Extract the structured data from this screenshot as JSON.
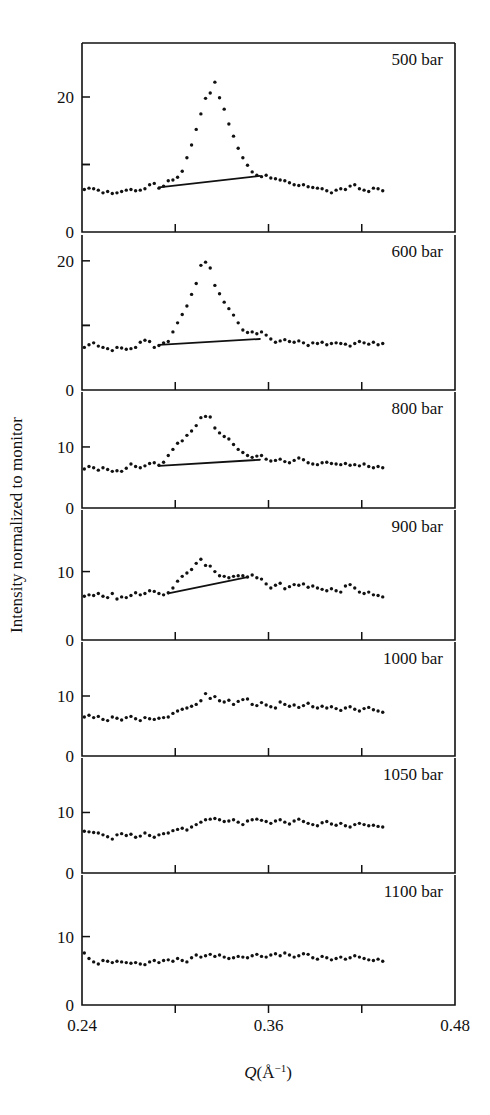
{
  "figure": {
    "type": "multi-panel-scatter",
    "y_axis_title": "Intensity normalized to monitor",
    "x_axis_title_main": "Q(",
    "x_axis_title_unit": "Å",
    "x_axis_title_exp": "−1",
    "x_axis_title_close": ")",
    "x_axis_title_full": "Q(Å⁻¹)"
  },
  "chart_data": {
    "type": "scatter",
    "title": "",
    "xlabel": "Q(Å⁻¹)",
    "ylabel": "Intensity normalized to monitor",
    "xlim": [
      0.24,
      0.48
    ],
    "xticks": [
      0.24,
      0.3,
      0.36,
      0.42,
      0.48
    ],
    "xtick_labels": [
      "0.24",
      "",
      "0.36",
      "",
      "0.48"
    ],
    "grid": false,
    "legend": "none",
    "panel_label_position": "top-right",
    "panels": [
      {
        "label": "500 bar",
        "ylim": [
          0,
          28
        ],
        "yticks": [
          0,
          10,
          20
        ],
        "ytick_labels": [
          "0",
          "",
          "20"
        ],
        "fit_line": {
          "x": [
            0.2895,
            0.3545
          ],
          "y": [
            6.6,
            8.3
          ]
        },
        "x": [
          0.2415,
          0.2445,
          0.2475,
          0.2505,
          0.2535,
          0.2565,
          0.2595,
          0.2625,
          0.2655,
          0.2685,
          0.2715,
          0.2745,
          0.2775,
          0.2805,
          0.2835,
          0.2865,
          0.2895,
          0.2925,
          0.2955,
          0.2985,
          0.3015,
          0.3045,
          0.3075,
          0.3105,
          0.3135,
          0.3165,
          0.3195,
          0.3225,
          0.3255,
          0.3285,
          0.3315,
          0.3345,
          0.3375,
          0.3405,
          0.3435,
          0.3465,
          0.3495,
          0.3525,
          0.3555,
          0.3585,
          0.3615,
          0.3645,
          0.3675,
          0.3705,
          0.3735,
          0.3765,
          0.3795,
          0.3825,
          0.3855,
          0.3885,
          0.3915,
          0.3945,
          0.3975,
          0.4005,
          0.4035,
          0.4065,
          0.4095,
          0.4125,
          0.4155,
          0.4185,
          0.4215,
          0.4245,
          0.4275,
          0.4305,
          0.4335
        ],
        "y": [
          6.3,
          6.5,
          6.4,
          6.2,
          5.8,
          6.0,
          5.7,
          5.8,
          6.0,
          6.2,
          6.3,
          6.1,
          6.2,
          6.4,
          7.0,
          7.2,
          6.5,
          6.8,
          7.6,
          7.7,
          8.1,
          9.0,
          11.0,
          12.9,
          15.2,
          17.5,
          19.8,
          20.6,
          22.2,
          19.9,
          18.2,
          16.0,
          14.2,
          12.4,
          11.0,
          9.9,
          8.9,
          8.4,
          8.2,
          8.4,
          8.0,
          7.9,
          7.7,
          7.6,
          7.3,
          7.0,
          6.9,
          7.0,
          6.7,
          6.6,
          6.5,
          6.4,
          6.1,
          5.8,
          6.2,
          6.4,
          6.3,
          6.8,
          7.0,
          6.4,
          6.2,
          6.0,
          6.5,
          6.4,
          6.1
        ]
      },
      {
        "label": "600 bar",
        "ylim": [
          0,
          24
        ],
        "yticks": [
          0,
          10,
          20
        ],
        "ytick_labels": [
          "0",
          "",
          "20"
        ],
        "fit_line": {
          "x": [
            0.2895,
            0.3545
          ],
          "y": [
            7.0,
            7.9
          ]
        },
        "x": [
          0.2415,
          0.2445,
          0.2475,
          0.2505,
          0.2535,
          0.2565,
          0.2595,
          0.2625,
          0.2655,
          0.2685,
          0.2715,
          0.2745,
          0.2775,
          0.2805,
          0.2835,
          0.2865,
          0.2895,
          0.2925,
          0.2955,
          0.2985,
          0.3015,
          0.3045,
          0.3075,
          0.3105,
          0.3135,
          0.3165,
          0.3195,
          0.3225,
          0.3255,
          0.3285,
          0.3315,
          0.3345,
          0.3375,
          0.3405,
          0.3435,
          0.3465,
          0.3495,
          0.3525,
          0.3555,
          0.3585,
          0.3615,
          0.3645,
          0.3675,
          0.3705,
          0.3735,
          0.3765,
          0.3795,
          0.3825,
          0.3855,
          0.3885,
          0.3915,
          0.3945,
          0.3975,
          0.4005,
          0.4035,
          0.4065,
          0.4095,
          0.4125,
          0.4155,
          0.4185,
          0.4215,
          0.4245,
          0.4275,
          0.4305,
          0.4335
        ],
        "y": [
          6.6,
          7.0,
          7.3,
          6.8,
          6.6,
          6.4,
          6.1,
          6.6,
          6.5,
          6.3,
          6.4,
          6.6,
          7.4,
          7.7,
          7.5,
          6.6,
          6.9,
          7.3,
          7.5,
          9.0,
          10.4,
          11.7,
          13.0,
          14.8,
          16.5,
          19.3,
          19.8,
          18.9,
          16.2,
          14.9,
          13.6,
          12.6,
          11.6,
          10.4,
          9.3,
          8.9,
          9.0,
          8.7,
          9.0,
          8.5,
          7.9,
          7.4,
          7.6,
          7.8,
          7.5,
          7.4,
          7.6,
          7.3,
          6.9,
          7.3,
          7.2,
          7.4,
          7.0,
          7.2,
          7.3,
          7.2,
          7.1,
          6.8,
          7.2,
          7.5,
          7.3,
          7.1,
          7.4,
          7.0,
          7.2
        ]
      },
      {
        "label": "800 bar",
        "ylim": [
          0,
          19
        ],
        "yticks": [
          0,
          10
        ],
        "ytick_labels": [
          "0",
          "10"
        ],
        "fit_line": {
          "x": [
            0.2895,
            0.3545
          ],
          "y": [
            6.9,
            7.9
          ]
        },
        "x": [
          0.2415,
          0.2445,
          0.2475,
          0.2505,
          0.2535,
          0.2565,
          0.2595,
          0.2625,
          0.2655,
          0.2685,
          0.2715,
          0.2745,
          0.2775,
          0.2805,
          0.2835,
          0.2865,
          0.2895,
          0.2925,
          0.2955,
          0.2985,
          0.3015,
          0.3045,
          0.3075,
          0.3105,
          0.3135,
          0.3165,
          0.3195,
          0.3225,
          0.3255,
          0.3285,
          0.3315,
          0.3345,
          0.3375,
          0.3405,
          0.3435,
          0.3465,
          0.3495,
          0.3525,
          0.3555,
          0.3585,
          0.3615,
          0.3645,
          0.3675,
          0.3705,
          0.3735,
          0.3765,
          0.3795,
          0.3825,
          0.3855,
          0.3885,
          0.3915,
          0.3945,
          0.3975,
          0.4005,
          0.4035,
          0.4065,
          0.4095,
          0.4125,
          0.4155,
          0.4185,
          0.4215,
          0.4245,
          0.4275,
          0.4305,
          0.4335
        ],
        "y": [
          6.4,
          6.8,
          6.6,
          6.2,
          6.6,
          6.3,
          6.0,
          6.1,
          6.0,
          6.5,
          7.2,
          6.8,
          6.6,
          6.9,
          7.3,
          7.4,
          7.0,
          7.5,
          8.6,
          9.6,
          10.6,
          11.0,
          11.9,
          12.6,
          13.5,
          14.8,
          15.0,
          14.9,
          13.1,
          12.3,
          11.7,
          11.3,
          10.4,
          9.6,
          9.1,
          8.6,
          8.3,
          8.5,
          8.6,
          8.0,
          7.7,
          7.8,
          8.0,
          7.6,
          7.4,
          7.8,
          8.2,
          7.9,
          7.4,
          7.2,
          7.1,
          7.4,
          7.5,
          7.3,
          7.2,
          7.1,
          7.3,
          7.0,
          7.1,
          6.9,
          7.2,
          6.8,
          6.6,
          6.8,
          6.6
        ]
      },
      {
        "label": "900 bar",
        "ylim": [
          0,
          19
        ],
        "yticks": [
          0,
          10
        ],
        "ytick_labels": [
          "0",
          "10"
        ],
        "fit_line": {
          "x": [
            0.2955,
            0.3465
          ],
          "y": [
            6.8,
            9.2
          ]
        },
        "x": [
          0.2415,
          0.2445,
          0.2475,
          0.2505,
          0.2535,
          0.2565,
          0.2595,
          0.2625,
          0.2655,
          0.2685,
          0.2715,
          0.2745,
          0.2775,
          0.2805,
          0.2835,
          0.2865,
          0.2895,
          0.2925,
          0.2955,
          0.2985,
          0.3015,
          0.3045,
          0.3075,
          0.3105,
          0.3135,
          0.3165,
          0.3195,
          0.3225,
          0.3255,
          0.3285,
          0.3315,
          0.3345,
          0.3375,
          0.3405,
          0.3435,
          0.3465,
          0.3495,
          0.3525,
          0.3555,
          0.3585,
          0.3615,
          0.3645,
          0.3675,
          0.3705,
          0.3735,
          0.3765,
          0.3795,
          0.3825,
          0.3855,
          0.3885,
          0.3915,
          0.3945,
          0.3975,
          0.4005,
          0.4035,
          0.4065,
          0.4095,
          0.4125,
          0.4155,
          0.4185,
          0.4215,
          0.4245,
          0.4275,
          0.4305,
          0.4335
        ],
        "y": [
          6.4,
          6.6,
          6.5,
          6.8,
          6.4,
          6.2,
          6.8,
          6.0,
          6.3,
          6.2,
          6.5,
          6.9,
          6.6,
          6.8,
          7.2,
          7.1,
          6.8,
          6.6,
          6.9,
          7.6,
          8.6,
          9.3,
          9.8,
          10.3,
          11.2,
          11.8,
          10.9,
          10.8,
          10.0,
          9.4,
          9.3,
          9.1,
          9.3,
          9.4,
          9.4,
          9.2,
          9.5,
          9.1,
          8.9,
          8.2,
          7.6,
          8.0,
          8.3,
          7.5,
          7.8,
          8.1,
          8.0,
          8.2,
          7.7,
          7.9,
          7.6,
          7.4,
          7.2,
          7.5,
          7.2,
          7.0,
          7.9,
          8.1,
          7.6,
          7.0,
          6.8,
          7.0,
          6.6,
          6.5,
          6.3
        ]
      },
      {
        "label": "1000 bar",
        "ylim": [
          0,
          19
        ],
        "yticks": [
          0,
          10
        ],
        "ytick_labels": [
          "0",
          "10"
        ],
        "fit_line": null,
        "x": [
          0.2415,
          0.2445,
          0.2475,
          0.2505,
          0.2535,
          0.2565,
          0.2595,
          0.2625,
          0.2655,
          0.2685,
          0.2715,
          0.2745,
          0.2775,
          0.2805,
          0.2835,
          0.2865,
          0.2895,
          0.2925,
          0.2955,
          0.2985,
          0.3015,
          0.3045,
          0.3075,
          0.3105,
          0.3135,
          0.3165,
          0.3195,
          0.3225,
          0.3255,
          0.3285,
          0.3315,
          0.3345,
          0.3375,
          0.3405,
          0.3435,
          0.3465,
          0.3495,
          0.3525,
          0.3555,
          0.3585,
          0.3615,
          0.3645,
          0.3675,
          0.3705,
          0.3735,
          0.3765,
          0.3795,
          0.3825,
          0.3855,
          0.3885,
          0.3915,
          0.3945,
          0.3975,
          0.4005,
          0.4035,
          0.4065,
          0.4095,
          0.4125,
          0.4155,
          0.4185,
          0.4215,
          0.4245,
          0.4275,
          0.4305,
          0.4335
        ],
        "y": [
          6.5,
          6.8,
          6.4,
          6.6,
          6.1,
          5.9,
          6.5,
          6.3,
          6.0,
          6.4,
          6.6,
          6.2,
          5.9,
          6.4,
          6.2,
          6.1,
          6.3,
          6.4,
          6.5,
          7.1,
          7.5,
          7.8,
          8.0,
          8.3,
          8.6,
          9.2,
          10.4,
          9.6,
          9.9,
          9.2,
          9.0,
          9.3,
          8.6,
          9.1,
          9.4,
          9.5,
          8.6,
          8.4,
          8.9,
          8.5,
          8.2,
          8.0,
          9.0,
          8.6,
          8.3,
          8.5,
          8.1,
          8.4,
          8.8,
          8.2,
          8.0,
          8.3,
          8.0,
          8.2,
          7.9,
          7.6,
          8.0,
          8.2,
          7.8,
          7.5,
          7.9,
          8.1,
          7.7,
          7.5,
          7.3
        ]
      },
      {
        "label": "1050 bar",
        "ylim": [
          0,
          19
        ],
        "yticks": [
          0,
          10
        ],
        "ytick_labels": [
          "0",
          "10"
        ],
        "fit_line": null,
        "x": [
          0.2415,
          0.2445,
          0.2475,
          0.2505,
          0.2535,
          0.2565,
          0.2595,
          0.2625,
          0.2655,
          0.2685,
          0.2715,
          0.2745,
          0.2775,
          0.2805,
          0.2835,
          0.2865,
          0.2895,
          0.2925,
          0.2955,
          0.2985,
          0.3015,
          0.3045,
          0.3075,
          0.3105,
          0.3135,
          0.3165,
          0.3195,
          0.3225,
          0.3255,
          0.3285,
          0.3315,
          0.3345,
          0.3375,
          0.3405,
          0.3435,
          0.3465,
          0.3495,
          0.3525,
          0.3555,
          0.3585,
          0.3615,
          0.3645,
          0.3675,
          0.3705,
          0.3735,
          0.3765,
          0.3795,
          0.3825,
          0.3855,
          0.3885,
          0.3915,
          0.3945,
          0.3975,
          0.4005,
          0.4035,
          0.4065,
          0.4095,
          0.4125,
          0.4155,
          0.4185,
          0.4215,
          0.4245,
          0.4275,
          0.4305,
          0.4335
        ],
        "y": [
          6.9,
          6.8,
          6.7,
          6.6,
          6.3,
          6.0,
          5.6,
          6.3,
          6.5,
          6.2,
          6.4,
          5.9,
          6.1,
          6.6,
          6.2,
          5.9,
          6.3,
          6.5,
          6.6,
          7.0,
          7.2,
          7.4,
          7.1,
          7.6,
          8.0,
          8.4,
          8.8,
          8.9,
          9.0,
          8.8,
          8.5,
          8.6,
          8.8,
          8.4,
          8.0,
          8.6,
          8.8,
          8.9,
          8.7,
          8.5,
          8.2,
          8.6,
          8.8,
          8.4,
          8.1,
          8.6,
          8.9,
          8.5,
          8.2,
          8.0,
          7.8,
          8.3,
          8.5,
          8.1,
          7.9,
          8.2,
          7.8,
          7.6,
          8.0,
          8.2,
          8.0,
          7.8,
          7.9,
          7.7,
          7.6
        ]
      },
      {
        "label": "1100 bar",
        "ylim": [
          0,
          19
        ],
        "yticks": [
          0,
          10
        ],
        "ytick_labels": [
          "0",
          "10"
        ],
        "fit_line": null,
        "x": [
          0.2415,
          0.2445,
          0.2475,
          0.2505,
          0.2535,
          0.2565,
          0.2595,
          0.2625,
          0.2655,
          0.2685,
          0.2715,
          0.2745,
          0.2775,
          0.2805,
          0.2835,
          0.2865,
          0.2895,
          0.2925,
          0.2955,
          0.2985,
          0.3015,
          0.3045,
          0.3075,
          0.3105,
          0.3135,
          0.3165,
          0.3195,
          0.3225,
          0.3255,
          0.3285,
          0.3315,
          0.3345,
          0.3375,
          0.3405,
          0.3435,
          0.3465,
          0.3495,
          0.3525,
          0.3555,
          0.3585,
          0.3615,
          0.3645,
          0.3675,
          0.3705,
          0.3735,
          0.3765,
          0.3795,
          0.3825,
          0.3855,
          0.3885,
          0.3915,
          0.3945,
          0.3975,
          0.4005,
          0.4035,
          0.4065,
          0.4095,
          0.4125,
          0.4155,
          0.4185,
          0.4215,
          0.4245,
          0.4275,
          0.4305,
          0.4335
        ],
        "y": [
          7.6,
          6.8,
          6.3,
          6.0,
          6.5,
          6.4,
          6.2,
          6.4,
          6.3,
          6.2,
          6.1,
          6.2,
          6.0,
          5.9,
          6.3,
          6.5,
          6.2,
          6.5,
          6.6,
          6.4,
          6.8,
          6.5,
          6.3,
          6.9,
          7.3,
          7.0,
          7.2,
          7.4,
          7.1,
          7.3,
          7.0,
          6.8,
          6.9,
          7.1,
          7.0,
          6.9,
          7.2,
          7.4,
          7.1,
          7.0,
          7.3,
          7.5,
          7.2,
          7.6,
          7.3,
          7.0,
          7.2,
          7.5,
          7.4,
          6.9,
          6.7,
          7.1,
          6.9,
          6.6,
          6.8,
          7.0,
          6.7,
          6.9,
          7.2,
          7.0,
          6.8,
          6.6,
          6.5,
          6.7,
          6.4
        ]
      }
    ]
  }
}
